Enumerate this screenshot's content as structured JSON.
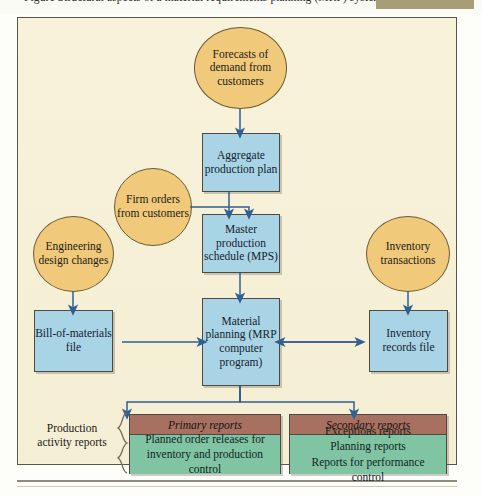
{
  "caption": {
    "text": "Figure   Structural aspects of a material requirements planning (MRP) system",
    "swatch_color": "#a79e78"
  },
  "colors": {
    "background": "#f7f1d8",
    "ellipse_fill": "#f0c97b",
    "rect_fill": "#a9d4e6",
    "report_header_fill": "#a87060",
    "report_body_fill": "#81c4a4",
    "arrow": "#2f5f93",
    "border": "#4c4a42"
  },
  "nodes": {
    "forecasts": "Forecasts of demand from customers",
    "firm_orders": "Firm orders from customers",
    "engineering": "Engineering design changes",
    "inventory_transactions": "Inventory transactions",
    "aggregate_plan": "Aggregate production plan",
    "mps": "Master production schedule (MPS)",
    "bom": "Bill-of-materials file",
    "mrp": "Material planning (MRP computer program)",
    "inventory_records": "Inventory records file"
  },
  "reports": {
    "group_label": "Production activity reports",
    "primary": {
      "title": "Primary reports",
      "lines": "Planned order releases for inventory and production control"
    },
    "secondary": {
      "title": "Secondary reports",
      "lines": "Exceptions reports\nPlanning reports\nReports for performance control"
    }
  }
}
